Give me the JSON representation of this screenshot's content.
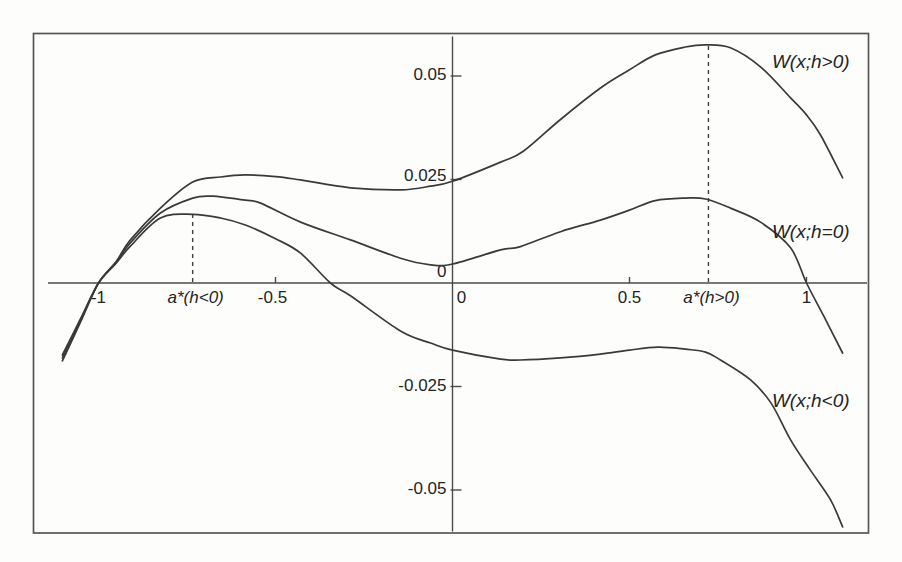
{
  "figure": {
    "background_color": "#fdfdfb",
    "ink_color": "#3a3a3a"
  },
  "chart_data": {
    "type": "line",
    "title": "",
    "xlabel": "",
    "ylabel": "",
    "xlim": [
      -1.18,
      1.18
    ],
    "ylim": [
      -0.061,
      0.06
    ],
    "grid": false,
    "legend": "inline-labels",
    "x_axis": {
      "ticks": [
        {
          "value": -1,
          "label": "-1",
          "mark": false,
          "dx": 0
        },
        {
          "value": -0.5,
          "label": "-0.5",
          "mark": true,
          "dx": -3
        },
        {
          "value": 0,
          "label": "0",
          "mark": false,
          "dx": 9
        },
        {
          "value": 0.5,
          "label": "0.5",
          "mark": true,
          "dx": 0
        },
        {
          "value": 1,
          "label": "1",
          "mark": true,
          "dx": 0
        }
      ]
    },
    "y_axis": {
      "ticks": [
        {
          "value": 0.05,
          "label": "0.05",
          "mark": true,
          "dy": 0
        },
        {
          "value": 0.025,
          "label": "0.025",
          "mark": true,
          "dy": -3
        },
        {
          "value": 0,
          "label": "0",
          "mark": false,
          "dy": -10
        },
        {
          "value": -0.025,
          "label": "-0.025",
          "mark": true,
          "dy": 0
        },
        {
          "value": -0.05,
          "label": "-0.05",
          "mark": true,
          "dy": 0
        }
      ]
    },
    "annotations": [
      {
        "name": "a-star-h-neg",
        "label": "a*(h<0)",
        "x": -0.734,
        "y_top": 0.0164
      },
      {
        "name": "a-star-h-pos",
        "label": "a*(h>0)",
        "x": 0.723,
        "y_top": 0.0575
      }
    ],
    "series": [
      {
        "name": "W-h-positive",
        "label": "W(x;h>0)",
        "label_pos": {
          "x": 1.012,
          "y": 0.0532
        },
        "points": [
          [
            -1.102,
            -0.0188
          ],
          [
            -1.05,
            -0.0093
          ],
          [
            -1.0,
            0.0
          ],
          [
            -0.95,
            0.0052
          ],
          [
            -0.91,
            0.0104
          ],
          [
            -0.825,
            0.0181
          ],
          [
            -0.734,
            0.0244
          ],
          [
            -0.655,
            0.0256
          ],
          [
            -0.585,
            0.0261
          ],
          [
            -0.5,
            0.0257
          ],
          [
            -0.429,
            0.0249
          ],
          [
            -0.288,
            0.023
          ],
          [
            -0.147,
            0.0225
          ],
          [
            -0.062,
            0.0234
          ],
          [
            0.0,
            0.0246
          ],
          [
            0.136,
            0.0292
          ],
          [
            0.2,
            0.0318
          ],
          [
            0.305,
            0.0395
          ],
          [
            0.418,
            0.0471
          ],
          [
            0.5,
            0.0515
          ],
          [
            0.573,
            0.0551
          ],
          [
            0.658,
            0.057
          ],
          [
            0.715,
            0.0575
          ],
          [
            0.785,
            0.0568
          ],
          [
            0.87,
            0.0522
          ],
          [
            0.955,
            0.0447
          ],
          [
            1.0,
            0.0406
          ],
          [
            1.04,
            0.0357
          ],
          [
            1.102,
            0.0254
          ]
        ]
      },
      {
        "name": "W-h-zero",
        "label": "W(x;h=0)",
        "label_pos": {
          "x": 1.012,
          "y": 0.0121
        },
        "points": [
          [
            -1.102,
            -0.0181
          ],
          [
            -1.05,
            -0.0089
          ],
          [
            -1.0,
            0.0
          ],
          [
            -0.95,
            0.005
          ],
          [
            -0.91,
            0.0097
          ],
          [
            -0.825,
            0.0169
          ],
          [
            -0.734,
            0.0205
          ],
          [
            -0.68,
            0.021
          ],
          [
            -0.655,
            0.0208
          ],
          [
            -0.585,
            0.02
          ],
          [
            -0.542,
            0.0193
          ],
          [
            -0.429,
            0.0147
          ],
          [
            -0.288,
            0.0104
          ],
          [
            -0.147,
            0.006
          ],
          [
            -0.062,
            0.0044
          ],
          [
            0.0,
            0.0046
          ],
          [
            0.136,
            0.008
          ],
          [
            0.192,
            0.0088
          ],
          [
            0.305,
            0.0124
          ],
          [
            0.418,
            0.0152
          ],
          [
            0.5,
            0.0176
          ],
          [
            0.573,
            0.0199
          ],
          [
            0.658,
            0.0205
          ],
          [
            0.715,
            0.0203
          ],
          [
            0.785,
            0.0181
          ],
          [
            0.87,
            0.0147
          ],
          [
            0.955,
            0.0085
          ],
          [
            1.0,
            0.0
          ],
          [
            1.05,
            -0.0082
          ],
          [
            1.102,
            -0.0169
          ]
        ]
      },
      {
        "name": "W-h-negative",
        "label": "W(x;h<0)",
        "label_pos": {
          "x": 1.012,
          "y": -0.0287
        },
        "points": [
          [
            -1.102,
            -0.0174
          ],
          [
            -1.05,
            -0.0085
          ],
          [
            -1.0,
            0.0
          ],
          [
            -0.95,
            0.0048
          ],
          [
            -0.91,
            0.0089
          ],
          [
            -0.825,
            0.0157
          ],
          [
            -0.734,
            0.0166
          ],
          [
            -0.655,
            0.0157
          ],
          [
            -0.585,
            0.014
          ],
          [
            -0.5,
            0.0107
          ],
          [
            -0.429,
            0.0072
          ],
          [
            -0.345,
            0.0
          ],
          [
            -0.288,
            -0.0031
          ],
          [
            -0.147,
            -0.0116
          ],
          [
            -0.062,
            -0.0145
          ],
          [
            0.0,
            -0.0162
          ],
          [
            0.136,
            -0.0184
          ],
          [
            0.192,
            -0.0186
          ],
          [
            0.305,
            -0.0181
          ],
          [
            0.418,
            -0.0172
          ],
          [
            0.5,
            -0.0162
          ],
          [
            0.58,
            -0.0155
          ],
          [
            0.658,
            -0.016
          ],
          [
            0.715,
            -0.0167
          ],
          [
            0.757,
            -0.0186
          ],
          [
            0.842,
            -0.0234
          ],
          [
            0.9,
            -0.029
          ],
          [
            0.955,
            -0.0379
          ],
          [
            1.011,
            -0.0452
          ],
          [
            1.068,
            -0.0524
          ],
          [
            1.102,
            -0.0589
          ]
        ]
      }
    ]
  }
}
